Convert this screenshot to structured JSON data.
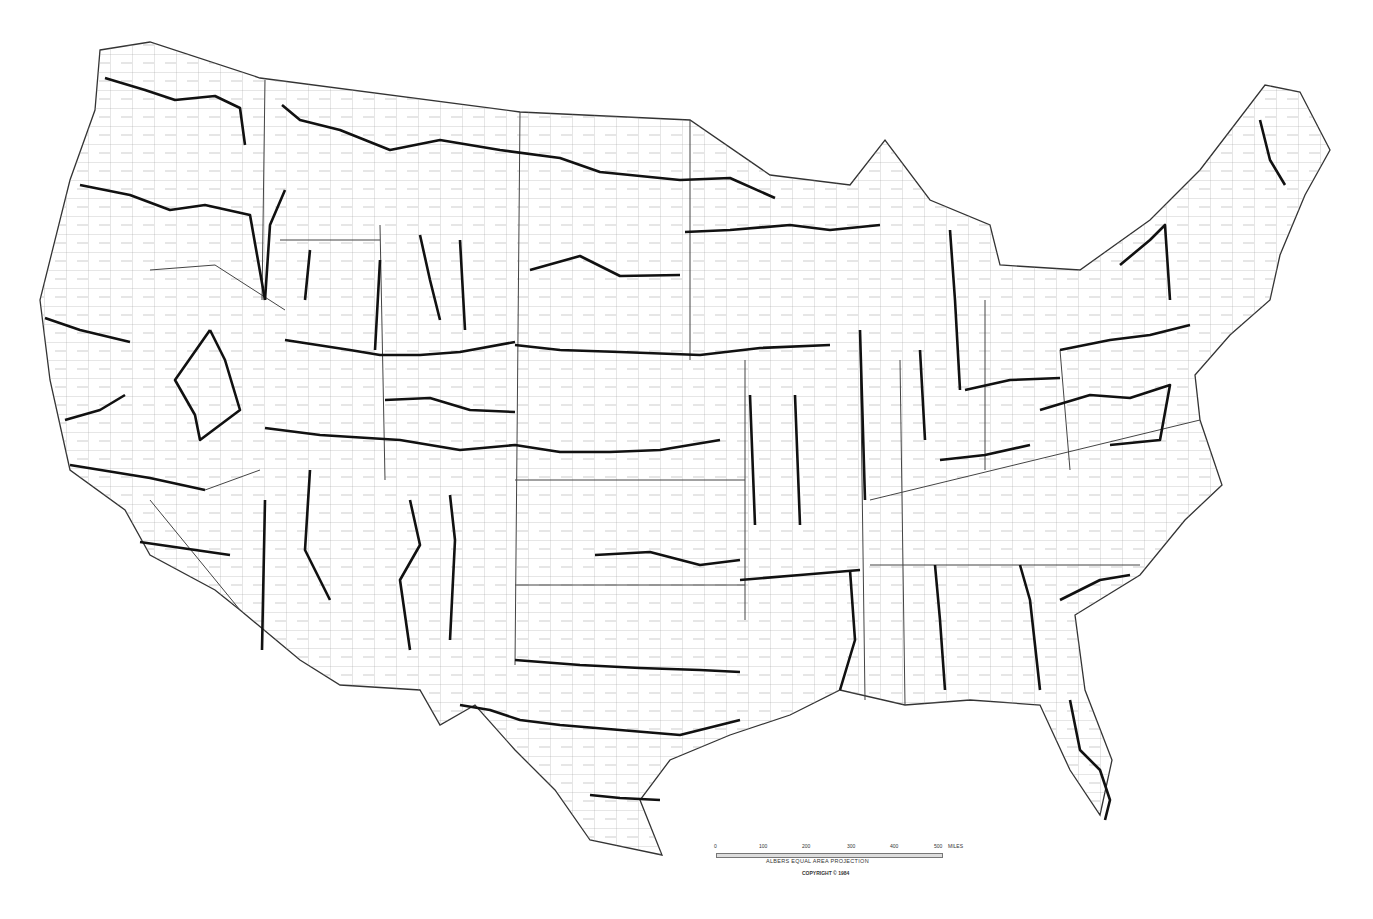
{
  "map": {
    "title": "",
    "description": "United States county outline map with thick regional boundary lines",
    "projection": "ALBERS EQUAL AREA PROJECTION",
    "copyright": "COPYRIGHT © 1984",
    "scale": {
      "ticks": [
        "0",
        "100",
        "200",
        "300",
        "400",
        "500"
      ],
      "units": "MILES"
    },
    "colors": {
      "background": "#ffffff",
      "county_lines": "#9a9a9a",
      "state_lines": "#444444",
      "thick_lines": "#111111"
    }
  }
}
